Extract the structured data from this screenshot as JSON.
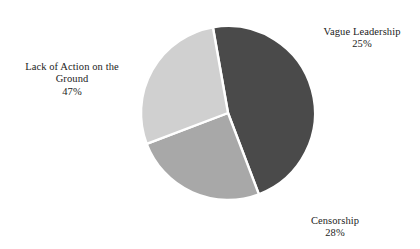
{
  "chart_data": {
    "type": "pie",
    "title": "",
    "subtitle": "",
    "xlabel": "",
    "ylabel": "",
    "legend_position": "none",
    "grid": false,
    "labels_outside": true,
    "background": "#ffffff",
    "separator_color": "#ffffff",
    "categories": [
      "Lack of Action on the Ground",
      "Vague Leadership",
      "Censorship"
    ],
    "values": [
      47,
      25,
      28
    ],
    "value_unit": "%",
    "value_labels": [
      "47%",
      "25%",
      "28%"
    ],
    "colors": [
      "#4a4a4a",
      "#a8a8a8",
      "#d0d0d0"
    ],
    "slices": [
      {
        "name": "Lack of Action on the Ground",
        "value": 47,
        "value_label": "47%",
        "color": "#4a4a4a",
        "label_lines": [
          "Lack of Action on the",
          "Ground"
        ]
      },
      {
        "name": "Vague Leadership",
        "value": 25,
        "value_label": "25%",
        "color": "#a8a8a8",
        "label_lines": [
          "Vague Leadership"
        ]
      },
      {
        "name": "Censorship",
        "value": 28,
        "value_label": "28%",
        "color": "#d0d0d0",
        "label_lines": [
          "Censorship"
        ]
      }
    ],
    "geometry": {
      "center_x": 228,
      "center_y": 113,
      "radius": 87,
      "start_angle_deg": -10
    }
  },
  "labels": {
    "lack_of_action": {
      "name": "Lack of Action on the Ground",
      "value": "47%"
    },
    "vague_leadership": {
      "name": "Vague Leadership",
      "value": "25%"
    },
    "censorship": {
      "name": "Censorship",
      "value": "28%"
    }
  }
}
